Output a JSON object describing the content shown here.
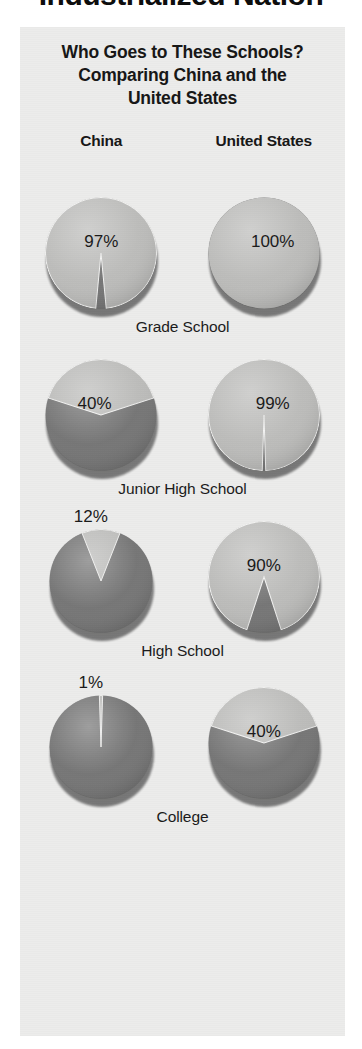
{
  "headline": "Industrialized Nation",
  "panel": {
    "title": "Who Goes to These Schools?\nComparing China and the\nUnited States",
    "title_lines": [
      "Who Goes to These Schools?",
      "Comparing China and the",
      "United States"
    ],
    "columns": [
      "China",
      "United States"
    ]
  },
  "colors": {
    "panel_background": "#ececeb",
    "page_background": "#ffffff",
    "slice_light": "#b9b9b7",
    "slice_dark": "#6f6f6f",
    "text": "#1a1a1a",
    "headline_text": "#0d0d0d"
  },
  "chart_data": {
    "type": "pie",
    "title": "Who Goes to These Schools? Comparing China and the United States",
    "legend": [
      "Attending (light gray)",
      "Not attending (dark gray)"
    ],
    "categories": [
      "Grade School",
      "Junior High School",
      "High School",
      "College"
    ],
    "series": [
      {
        "name": "China",
        "values": [
          97,
          40,
          12,
          1
        ]
      },
      {
        "name": "United States",
        "values": [
          100,
          99,
          90,
          40
        ]
      }
    ],
    "units": "percent",
    "rows": [
      {
        "label": "Grade School",
        "china": {
          "value": 97,
          "label": "97%",
          "label_position": "inside"
        },
        "usa": {
          "value": 100,
          "label": "100%",
          "label_position": "inside"
        }
      },
      {
        "label": "Junior High School",
        "china": {
          "value": 40,
          "label": "40%",
          "label_position": "inside"
        },
        "usa": {
          "value": 99,
          "label": "99%",
          "label_position": "inside"
        }
      },
      {
        "label": "High School",
        "china": {
          "value": 12,
          "label": "12%",
          "label_position": "above"
        },
        "usa": {
          "value": 90,
          "label": "90%",
          "label_position": "inside"
        }
      },
      {
        "label": "College",
        "china": {
          "value": 1,
          "label": "1%",
          "label_position": "above"
        },
        "usa": {
          "value": 40,
          "label": "40%",
          "label_position": "inside"
        }
      }
    ]
  }
}
